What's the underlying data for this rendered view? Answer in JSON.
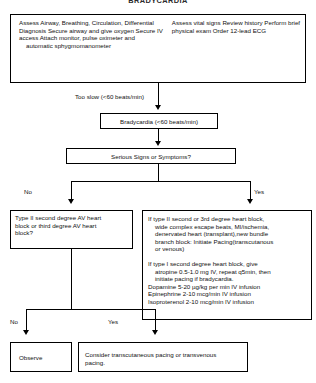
{
  "title": "BRADYCARDIA",
  "assessment": {
    "left_column": "Assess Airway, Breathing, Circulation,\nDifferential Diagnosis\nSecure airway and give oxygen\nSecure IV access\nAttach monitor, pulse oximeter and",
    "left_column_indent": "automatic sphygmomanometer",
    "right_column": "Assess vital signs\nReview history\nPerform brief physical exam\nOrder 12-lead ECG"
  },
  "connectors": {
    "too_slow_label": "Too slow (<60 beats/min)",
    "branch1_no": "No",
    "branch1_yes": "Yes",
    "branch2_no": "No",
    "branch2_yes": "Yes"
  },
  "nodes": {
    "bradycardia": "Bradycardia (<60 beats/min)",
    "serious_signs": "Serious Signs or Symptoms?",
    "heart_block_question": "Type II second degree AV heart\nblock or third degree AV  heart\nblock?",
    "observe": "Observe",
    "consider_pacing": "Consider transcutaneous pacing or transvenous\npacing."
  },
  "treatment": {
    "line1": "If type II second or 3rd degree heart block,",
    "line2": "wide complex escape beats, MI/ischemia,",
    "line3": "denervated heart (transplant),new bundle",
    "line4": "branch block: Initiate Pacing(transcutanous",
    "line5": "or venous)",
    "line6": "If type I second degree heart block, give",
    "line7": "atropine 0.5-1.0 mg IV, repeat q5min, then",
    "line8": "initiate pacing if bradycardia.",
    "line9": "Dopamine 5-20 µg/kg per min IV infusion",
    "line10": "Epinephrine 2-10 mcg/min IV infusion",
    "line11": "Isoproterenol 2-10 mcg/min  IV infusion"
  }
}
